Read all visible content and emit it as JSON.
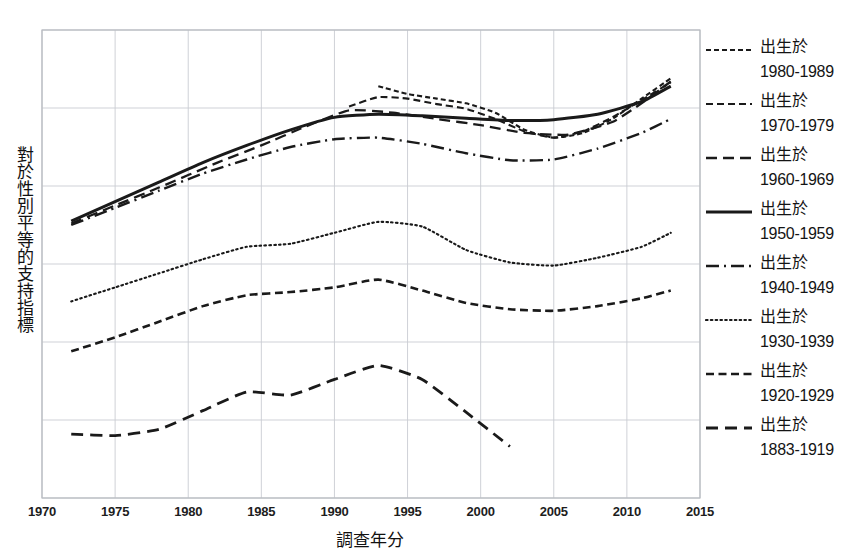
{
  "chart_data": {
    "type": "line",
    "title": "",
    "xlabel": "調查年分",
    "ylabel": "對於性別平等的支持指標",
    "xlim": [
      1970,
      2015
    ],
    "ylim": [
      0,
      6
    ],
    "xticks": [
      1970,
      1975,
      1980,
      1985,
      1990,
      1995,
      2000,
      2005,
      2010,
      2015
    ],
    "xtick_labels": [
      "1970",
      "1975",
      "1980",
      "1985",
      "1990",
      "1995",
      "2000",
      "2005",
      "2010",
      "2015"
    ],
    "yticks": [],
    "ytick_labels": [],
    "grid": true,
    "legend_position": "right",
    "legend_prefix": "出生於",
    "series": [
      {
        "name": "出生於 1980-1989",
        "cohort": "1980-1989",
        "style": "finely-dashed",
        "dasharray": "5,3",
        "width": 2.1,
        "x": [
          1993,
          1995,
          1997,
          1999,
          2001,
          2003,
          2005,
          2007,
          2009,
          2011,
          2013
        ],
        "y": [
          5.28,
          5.18,
          5.12,
          5.06,
          4.94,
          4.72,
          4.62,
          4.68,
          4.86,
          5.12,
          5.38
        ]
      },
      {
        "name": "出生於 1970-1979",
        "cohort": "1970-1979",
        "style": "short-dashed",
        "dasharray": "7,4",
        "width": 2.1,
        "x": [
          1991,
          1993,
          1995,
          1997,
          1999,
          2001,
          2003,
          2005,
          2007,
          2009,
          2011,
          2013
        ],
        "y": [
          5.02,
          5.14,
          5.12,
          5.05,
          4.99,
          4.86,
          4.7,
          4.62,
          4.7,
          4.88,
          5.1,
          5.33
        ]
      },
      {
        "name": "出生於 1960-1969",
        "cohort": "1960-1969",
        "style": "medium-dashed",
        "dasharray": "11,6",
        "width": 2.3,
        "x": [
          1972,
          1975,
          1978,
          1982,
          1985,
          1988,
          1991,
          1994,
          1997,
          2000,
          2003,
          2006,
          2009,
          2011,
          2013
        ],
        "y": [
          3.52,
          3.75,
          3.98,
          4.3,
          4.52,
          4.76,
          4.97,
          4.94,
          4.86,
          4.78,
          4.68,
          4.66,
          4.82,
          5.06,
          5.34
        ]
      },
      {
        "name": "出生於 1950-1959",
        "cohort": "1950-1959",
        "style": "solid",
        "dasharray": "none",
        "width": 3.0,
        "x": [
          1972,
          1975,
          1978,
          1981,
          1984,
          1987,
          1990,
          1993,
          1996,
          1999,
          2002,
          2005,
          2008,
          2011,
          2013
        ],
        "y": [
          3.55,
          3.8,
          4.05,
          4.3,
          4.52,
          4.72,
          4.88,
          4.92,
          4.9,
          4.87,
          4.84,
          4.85,
          4.92,
          5.08,
          5.28
        ]
      },
      {
        "name": "出生於 1940-1949",
        "cohort": "1940-1949",
        "style": "dash-dot",
        "dasharray": "13,5,2,5",
        "width": 2.4,
        "x": [
          1972,
          1975,
          1978,
          1981,
          1984,
          1987,
          1990,
          1993,
          1996,
          1999,
          2002,
          2005,
          2008,
          2011,
          2013
        ],
        "y": [
          3.5,
          3.72,
          3.94,
          4.16,
          4.34,
          4.5,
          4.6,
          4.62,
          4.54,
          4.42,
          4.33,
          4.34,
          4.48,
          4.68,
          4.86
        ]
      },
      {
        "name": "出生於 1930-1939",
        "cohort": "1930-1939",
        "style": "dotted",
        "dasharray": "1.6,3.2",
        "width": 2.1,
        "x": [
          1972,
          1975,
          1978,
          1981,
          1984,
          1987,
          1990,
          1993,
          1996,
          1999,
          2002,
          2005,
          2008,
          2011,
          2013
        ],
        "y": [
          2.52,
          2.7,
          2.88,
          3.06,
          3.22,
          3.26,
          3.4,
          3.54,
          3.48,
          3.18,
          3.02,
          2.98,
          3.08,
          3.22,
          3.4
        ]
      },
      {
        "name": "出生於 1920-1929",
        "cohort": "1920-1929",
        "style": "small-dashed",
        "dasharray": "8,4.5",
        "width": 2.6,
        "x": [
          1972,
          1975,
          1978,
          1981,
          1984,
          1987,
          1990,
          1993,
          1996,
          1999,
          2002,
          2005,
          2008,
          2011,
          2013
        ],
        "y": [
          1.88,
          2.06,
          2.26,
          2.46,
          2.6,
          2.64,
          2.7,
          2.8,
          2.66,
          2.5,
          2.42,
          2.4,
          2.46,
          2.56,
          2.66
        ]
      },
      {
        "name": "出生於 1883-1919",
        "cohort": "1883-1919",
        "style": "long-dashed",
        "dasharray": "12,7",
        "width": 2.8,
        "x": [
          1972,
          1975,
          1978,
          1981,
          1984,
          1987,
          1990,
          1993,
          1996,
          1999,
          2002
        ],
        "y": [
          0.82,
          0.8,
          0.88,
          1.12,
          1.36,
          1.32,
          1.52,
          1.7,
          1.52,
          1.1,
          0.66
        ]
      }
    ]
  },
  "legend": {
    "entries": [
      {
        "prefix": "出生於",
        "range": "1980-1989"
      },
      {
        "prefix": "出生於",
        "range": "1970-1979"
      },
      {
        "prefix": "出生於",
        "range": "1960-1969"
      },
      {
        "prefix": "出生於",
        "range": "1950-1959"
      },
      {
        "prefix": "出生於",
        "range": "1940-1949"
      },
      {
        "prefix": "出生於",
        "range": "1930-1939"
      },
      {
        "prefix": "出生於",
        "range": "1920-1929"
      },
      {
        "prefix": "出生於",
        "range": "1883-1919"
      }
    ]
  },
  "colors": {
    "line": "#1a1a1a",
    "grid": "#c9ccd2",
    "frame": "#b9bcc2",
    "text": "#141414",
    "background": "#ffffff"
  }
}
